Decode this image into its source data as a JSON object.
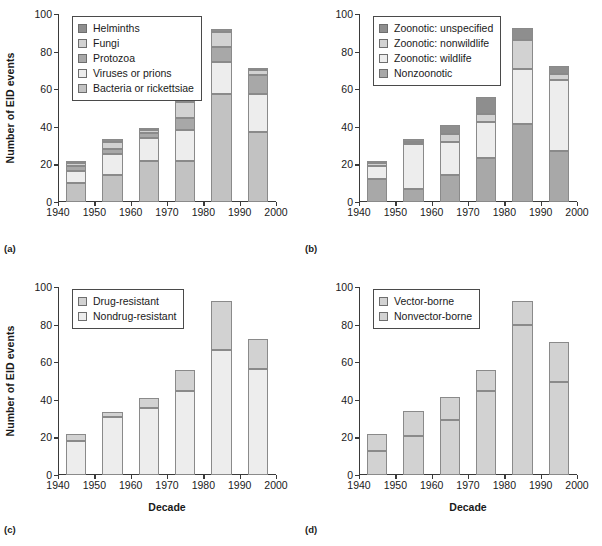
{
  "figure": {
    "ylabel": "Number of EID events",
    "xlabel": "Decade",
    "yticks": [
      "0",
      "20",
      "40",
      "60",
      "80",
      "100"
    ],
    "xticks": [
      "1940",
      "1950",
      "1960",
      "1970",
      "1980",
      "1990",
      "2000"
    ],
    "ylim": [
      0,
      100
    ],
    "xlim": [
      1940,
      2000
    ],
    "panel_labels": {
      "a": "(a)",
      "b": "(b)",
      "c": "(c)",
      "d": "(d)"
    },
    "colors": {
      "dark_gray": "#8e8e8e",
      "mid_gray": "#a8a8a8",
      "light_gray": "#d2d2d2",
      "pale_gray": "#ededed",
      "base_gray": "#c2c2c2",
      "axis": "#3a3a3a"
    }
  },
  "chart_data": [
    {
      "id": "a",
      "type": "bar",
      "stacked": true,
      "title": "",
      "xlabel": "",
      "ylabel": "Number of EID events",
      "ylim": [
        0,
        100
      ],
      "grid": false,
      "legend_position": "top-left",
      "categories": [
        "1940s",
        "1950s",
        "1960s",
        "1970s",
        "1980s",
        "1990s"
      ],
      "series": [
        {
          "name": "Bacteria or rickettsiae",
          "color": "#c2c2c2",
          "values": [
            10.0,
            14.5,
            22.0,
            22.0,
            57.5,
            37.5
          ]
        },
        {
          "name": "Viruses or prions",
          "color": "#ededed",
          "values": [
            6.5,
            11.0,
            12.0,
            16.5,
            17.0,
            20.0
          ]
        },
        {
          "name": "Protozoa",
          "color": "#a8a8a8",
          "values": [
            2.5,
            2.5,
            2.5,
            6.0,
            8.0,
            10.0
          ]
        },
        {
          "name": "Fungi",
          "color": "#d2d2d2",
          "values": [
            2.0,
            4.0,
            2.0,
            8.5,
            8.0,
            2.5
          ]
        },
        {
          "name": "Helminths",
          "color": "#8e8e8e",
          "values": [
            1.0,
            1.5,
            1.0,
            1.0,
            1.5,
            1.5
          ]
        }
      ],
      "totals": [
        22.0,
        33.5,
        39.5,
        54.0,
        92.0,
        71.5
      ]
    },
    {
      "id": "b",
      "type": "bar",
      "stacked": true,
      "title": "",
      "xlabel": "",
      "ylabel": "",
      "ylim": [
        0,
        100
      ],
      "grid": false,
      "legend_position": "top-left",
      "categories": [
        "1940s",
        "1950s",
        "1960s",
        "1970s",
        "1980s",
        "1990s"
      ],
      "series": [
        {
          "name": "Nonzoonotic",
          "color": "#a8a8a8",
          "values": [
            12.0,
            7.0,
            14.5,
            23.5,
            41.5,
            27.0
          ]
        },
        {
          "name": "Zoonotic: wildlife",
          "color": "#ededed",
          "values": [
            7.0,
            24.0,
            17.5,
            19.0,
            29.5,
            38.0
          ]
        },
        {
          "name": "Zoonotic: nonwildlife",
          "color": "#d2d2d2",
          "values": [
            1.5,
            1.0,
            4.0,
            4.5,
            15.0,
            3.0
          ]
        },
        {
          "name": "Zoonotic: unspecified",
          "color": "#8e8e8e",
          "values": [
            1.5,
            1.5,
            5.0,
            9.0,
            6.5,
            4.5
          ]
        }
      ],
      "totals": [
        22.0,
        33.5,
        41.0,
        56.0,
        92.5,
        72.5
      ]
    },
    {
      "id": "c",
      "type": "bar",
      "stacked": true,
      "title": "",
      "xlabel": "Decade",
      "ylabel": "Number of EID events",
      "ylim": [
        0,
        100
      ],
      "grid": false,
      "legend_position": "top-left",
      "categories": [
        "1940s",
        "1950s",
        "1960s",
        "1970s",
        "1980s",
        "1990s"
      ],
      "series": [
        {
          "name": "Nondrug-resistant",
          "color": "#ededed",
          "values": [
            18.0,
            31.0,
            35.5,
            44.5,
            66.5,
            56.5
          ]
        },
        {
          "name": "Drug-resistant",
          "color": "#d2d2d2",
          "values": [
            4.0,
            2.5,
            5.5,
            11.5,
            26.0,
            16.0
          ]
        }
      ],
      "totals": [
        22.0,
        33.5,
        41.0,
        56.0,
        92.5,
        72.5
      ]
    },
    {
      "id": "d",
      "type": "bar",
      "stacked": true,
      "title": "",
      "xlabel": "Decade",
      "ylabel": "",
      "ylim": [
        0,
        100
      ],
      "grid": false,
      "legend_position": "top-left",
      "categories": [
        "1940s",
        "1950s",
        "1960s",
        "1970s",
        "1980s",
        "1990s"
      ],
      "series": [
        {
          "name": "Nonvector-borne",
          "color": "#d2d2d2",
          "values": [
            13.0,
            21.0,
            29.5,
            44.5,
            80.0,
            49.5
          ]
        },
        {
          "name": "Vector-borne",
          "color": "#d2d2d2",
          "values": [
            9.0,
            13.0,
            12.0,
            11.5,
            12.5,
            21.5
          ]
        }
      ],
      "totals": [
        22.0,
        34.0,
        41.5,
        56.0,
        92.5,
        71.0
      ]
    }
  ]
}
